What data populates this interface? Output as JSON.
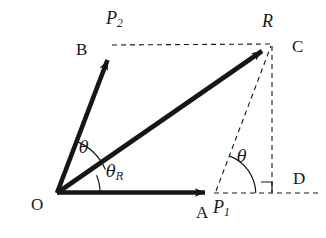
{
  "figure": {
    "background_color": "#ffffff",
    "stroke_color": "#161616",
    "width": 326,
    "height": 238,
    "points": {
      "O": {
        "x": 57,
        "y": 193,
        "label": "O"
      },
      "A": {
        "x": 215,
        "y": 193,
        "label": "A"
      },
      "B": {
        "x": 113,
        "y": 48,
        "label": "B"
      },
      "R": {
        "x": 272,
        "y": 44,
        "label": "R"
      },
      "C": {
        "x": 272,
        "y": 44,
        "label": "C"
      },
      "D": {
        "x": 272,
        "y": 193,
        "label": "D"
      }
    },
    "labels": {
      "origin": "O",
      "vector_b": "B",
      "vector_a": "A",
      "corner_c": "C",
      "foot_d": "D",
      "resultant": "R",
      "force_1": "P",
      "force_1_sub": "1",
      "force_2": "P",
      "force_2_sub": "2",
      "angle_theta": "θ",
      "angle_theta_r": "θ",
      "angle_theta_r_sub": "R",
      "angle_theta_at_p1": "θ"
    },
    "vectors": [
      {
        "name": "P1",
        "from": "O",
        "to": "A",
        "style": "solid-arrow",
        "label": "P₁"
      },
      {
        "name": "P2",
        "from": "O",
        "to": "B",
        "style": "solid-arrow",
        "label": "P₂"
      },
      {
        "name": "R",
        "from": "O",
        "to": "R",
        "style": "solid-arrow",
        "label": "R"
      }
    ],
    "construction_lines": [
      {
        "name": "B-to-R",
        "style": "dashed"
      },
      {
        "name": "A-to-D",
        "style": "dashed"
      },
      {
        "name": "R-to-D",
        "style": "dashed"
      },
      {
        "name": "A-to-R",
        "style": "dashed"
      }
    ],
    "angle_marks": [
      {
        "name": "theta-at-origin",
        "vertex": "O",
        "label": "θ"
      },
      {
        "name": "theta-r-at-origin",
        "vertex": "O",
        "label": "θR"
      },
      {
        "name": "theta-at-A",
        "vertex": "A",
        "label": "θ"
      },
      {
        "name": "right-angle-at-D",
        "vertex": "D",
        "label": ""
      }
    ]
  }
}
